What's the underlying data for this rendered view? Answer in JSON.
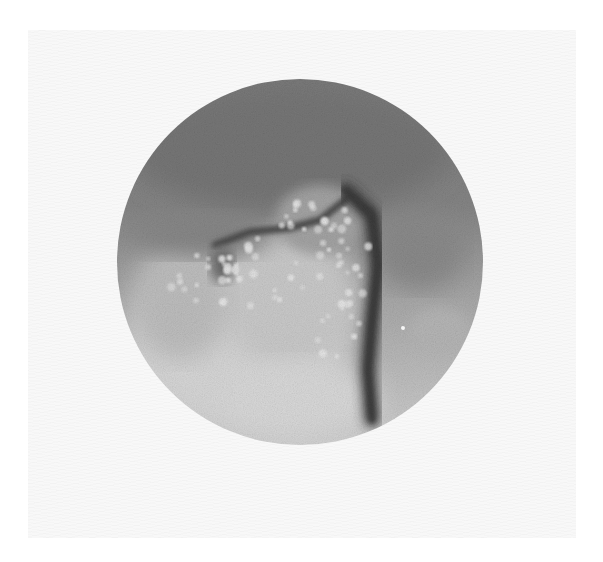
{
  "image": {
    "description": "Grayscale circular endoscopic/microscopic field showing nodular mucosa with a dark fold",
    "background_color": "#ffffff",
    "print_area": {
      "x": 28,
      "y": 30,
      "width": 548,
      "height": 508,
      "color": "#f8f8f8"
    },
    "field": {
      "center_x": 300,
      "center_y": 262,
      "radius": 183
    },
    "tones": {
      "upper_dark_gray": "#777777",
      "mid_gray": "#8e8e8e",
      "light_gray": "#c4c4c4",
      "bright_area": "#dcdcdc",
      "fold_dark": "#2e2e2e",
      "nodule_highlight": "#e6e6e6"
    },
    "features": {
      "fold": {
        "points": [
          [
            345,
            190
          ],
          [
            372,
            215
          ],
          [
            378,
            265
          ],
          [
            372,
            320
          ],
          [
            368,
            370
          ],
          [
            372,
            420
          ]
        ]
      },
      "upper_ridge": {
        "points": [
          [
            215,
            245
          ],
          [
            250,
            232
          ],
          [
            290,
            228
          ],
          [
            320,
            220
          ],
          [
            345,
            200
          ]
        ]
      },
      "specular_speck": {
        "x": 403,
        "y": 328,
        "r": 2
      },
      "nodule_clusters": [
        {
          "cx": 320,
          "cy": 215,
          "rx": 45,
          "ry": 30,
          "count": 18
        },
        {
          "cx": 345,
          "cy": 265,
          "rx": 28,
          "ry": 45,
          "count": 16
        },
        {
          "cx": 265,
          "cy": 270,
          "rx": 45,
          "ry": 40,
          "count": 20
        },
        {
          "cx": 200,
          "cy": 280,
          "rx": 40,
          "ry": 35,
          "count": 14
        },
        {
          "cx": 340,
          "cy": 330,
          "rx": 25,
          "ry": 35,
          "count": 10
        }
      ]
    }
  }
}
